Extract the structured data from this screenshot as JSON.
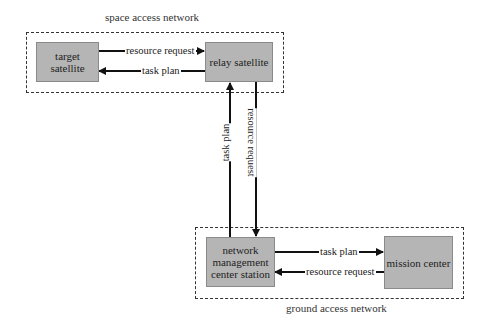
{
  "diagram": {
    "groups": {
      "space": {
        "label": "space access network"
      },
      "ground": {
        "label": "ground access network"
      }
    },
    "nodes": {
      "target_satellite": {
        "label": "target\nsatellite",
        "line1": "target",
        "line2": "satellite"
      },
      "relay_satellite": {
        "label": "relay satellite"
      },
      "nmcs": {
        "label": "network management center station",
        "line1": "network",
        "line2": "management",
        "line3": "center station"
      },
      "mission_center": {
        "label": "mission center"
      }
    },
    "edges": [
      {
        "from": "target satellite",
        "to": "relay satellite",
        "label": "resource request"
      },
      {
        "from": "relay satellite",
        "to": "target satellite",
        "label": "task plan"
      },
      {
        "from": "network management center station",
        "to": "relay satellite",
        "label": "task plan"
      },
      {
        "from": "relay satellite",
        "to": "network management center station",
        "label": "resource request"
      },
      {
        "from": "network management center station",
        "to": "mission center",
        "label": "task plan"
      },
      {
        "from": "mission center",
        "to": "network management center station",
        "label": "resource request"
      }
    ],
    "colors": {
      "node_fill": "#b5b5b5",
      "line": "#111111",
      "dashed_border": "#333333"
    }
  }
}
